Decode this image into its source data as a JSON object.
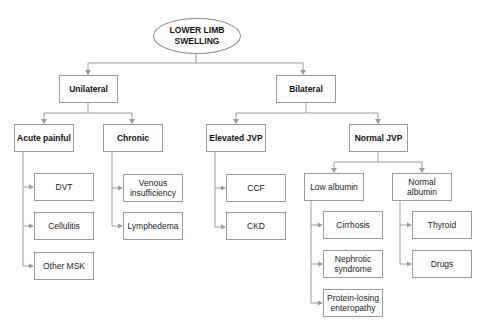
{
  "diagram": {
    "title": "Lower limb swelling",
    "root": {
      "label": "LOWER LIMB\nSWELLING"
    },
    "level1": {
      "unilateral": {
        "label": "Unilateral"
      },
      "bilateral": {
        "label": "Bilateral"
      }
    },
    "level2": {
      "acute_painful": {
        "label": "Acute painful"
      },
      "chronic": {
        "label": "Chronic"
      },
      "elevated_jvp": {
        "label": "Elevated JVP"
      },
      "normal_jvp": {
        "label": "Normal JVP"
      }
    },
    "level3": {
      "low_albumin": {
        "label": "Low albumin"
      },
      "normal_albumin": {
        "label": "Normal\nalbumin"
      }
    },
    "leaves": {
      "acute_painful": [
        "DVT",
        "Cellulitis",
        "Other MSK"
      ],
      "chronic": [
        "Venous\ninsufficiency",
        "Lymphedema"
      ],
      "elevated_jvp": [
        "CCF",
        "CKD"
      ],
      "low_albumin": [
        "Cirrhosis",
        "Nephrotic\nsyndrome",
        "Protein-losing\nenteropathy"
      ],
      "normal_albumin": [
        "Thyroid",
        "Drugs"
      ]
    },
    "colors": {
      "line": "#9b9b9b",
      "border": "#9b9b9b",
      "text": "#222222",
      "background": "#ffffff"
    }
  }
}
